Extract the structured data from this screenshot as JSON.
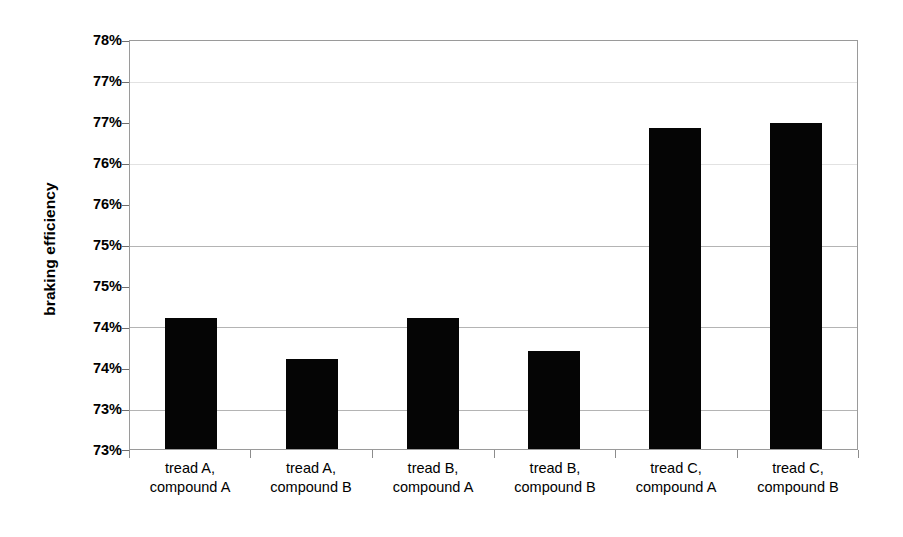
{
  "chart_data": {
    "type": "bar",
    "title": "",
    "xlabel": "",
    "ylabel": "braking efficiency",
    "ylim": [
      73,
      78
    ],
    "ytick_values": [
      73,
      73.5,
      74,
      74.5,
      75,
      75.5,
      76,
      76.5,
      77,
      77.5,
      78
    ],
    "ytick_labels": [
      "73%",
      "73%",
      "74%",
      "74%",
      "75%",
      "75%",
      "76%",
      "76%",
      "77%",
      "77%",
      "78%"
    ],
    "grid": true,
    "legend": "none",
    "categories": [
      "tread A, compound A",
      "tread A, compound B",
      "tread B, compound A",
      "tread B, compound B",
      "tread C, compound A",
      "tread C, compound B"
    ],
    "category_lines": [
      [
        "tread A,",
        "compound A"
      ],
      [
        "tread A,",
        "compound B"
      ],
      [
        "tread B,",
        "compound A"
      ],
      [
        "tread B,",
        "compound B"
      ],
      [
        "tread C,",
        "compound A"
      ],
      [
        "tread C,",
        "compound B"
      ]
    ],
    "values": [
      74.6,
      74.1,
      74.6,
      74.2,
      76.93,
      77.0
    ],
    "bar_color": "#050505",
    "plot_border_color": "#9a9a9a",
    "gridline_color": "#b4b4b4",
    "background_color": "#ffffff"
  }
}
